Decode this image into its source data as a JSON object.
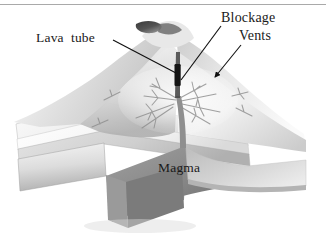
{
  "figure": {
    "type": "geological-cross-section",
    "background_color": "#ffffff",
    "rendering": "grayscale pencil / airbrush illustration",
    "top_rule_color": "#a9a9a9"
  },
  "labels": {
    "lava_tube": "Lava  tube",
    "blockage": "Blockage",
    "vents": "Vents",
    "magma": "Magma"
  },
  "leaders": [
    {
      "name": "lava-tube-leader",
      "label": "Lava  tube",
      "from": [
        113,
        40
      ],
      "to": [
        176,
        73
      ],
      "arrowhead": false
    },
    {
      "name": "blockage-leader",
      "label": "Blockage",
      "from": [
        221,
        26
      ],
      "to": [
        181,
        80
      ],
      "arrowhead": false
    },
    {
      "name": "vents-leader",
      "label": "Vents",
      "from": [
        241,
        45
      ],
      "to": [
        215,
        77
      ],
      "arrowhead": true
    }
  ],
  "features": {
    "summit_crater": "dark elliptical crater opening at the volcano summit",
    "central_conduit": "dark vertical magma conduit rising from the magma body to the crater",
    "blockage_plug": "dark plug blocking the upper conduit",
    "vent_network": "branching radial dikes and vents spreading through both flanks",
    "strata": "horizontally layered sedimentary rock exposed in the cut-away block",
    "magma_body": "dark grey magma reservoir beneath the volcano"
  },
  "colors": {
    "ink": "#1a1a1a",
    "rule": "#a9a9a9",
    "cone_light": "#f2f2f2",
    "cone_mid": "#d6d6d6",
    "cone_shadow": "#9c9c9c",
    "strata_light": "#f5f5f5",
    "strata_dark": "#b9b9b9",
    "magma_dark": "#8b8b8b",
    "magma_darker": "#6e6e6e",
    "conduit": "#2b2b2b"
  }
}
